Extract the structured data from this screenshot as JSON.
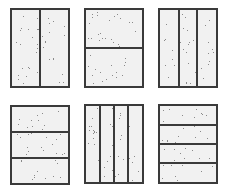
{
  "panels": [
    {
      "id": "halves-vertical",
      "x": 10,
      "y": 8,
      "w": 60,
      "h": 80,
      "orientation": "vertical",
      "divisions": 2
    },
    {
      "id": "halves-horizontal",
      "x": 84,
      "y": 8,
      "w": 60,
      "h": 80,
      "orientation": "horizontal",
      "divisions": 2
    },
    {
      "id": "thirds-vertical",
      "x": 158,
      "y": 8,
      "w": 60,
      "h": 80,
      "orientation": "vertical",
      "divisions": 3
    },
    {
      "id": "thirds-horizontal",
      "x": 10,
      "y": 105,
      "w": 60,
      "h": 80,
      "orientation": "horizontal",
      "divisions": 3
    },
    {
      "id": "quarters-vertical",
      "x": 84,
      "y": 104,
      "w": 60,
      "h": 80,
      "orientation": "vertical",
      "divisions": 4
    },
    {
      "id": "quarters-horizontal",
      "x": 158,
      "y": 104,
      "w": 60,
      "h": 80,
      "orientation": "horizontal",
      "divisions": 4
    }
  ],
  "colors": {
    "border": "#3a3a3a",
    "fill": "#f1f1f1",
    "speckle": "#8a8a8a"
  }
}
